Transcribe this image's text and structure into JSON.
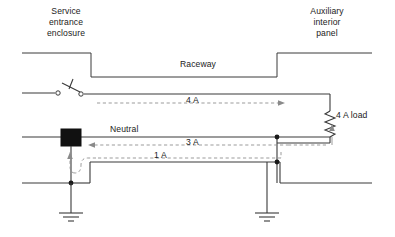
{
  "diagram": {
    "type": "electrical-one-line",
    "background_color": "#ffffff",
    "line_color": "#3a3a3a",
    "flow_color": "#8a8a8a",
    "labels": {
      "service_entrance": "Service\nentrance\nenclosure",
      "service_entrance_line1": "Service",
      "service_entrance_line2": "entrance",
      "service_entrance_line3": "enclosure",
      "auxiliary_panel_line1": "Auxiliary",
      "auxiliary_panel_line2": "interior",
      "auxiliary_panel_line3": "panel",
      "raceway": "Raceway",
      "neutral": "Neutral",
      "load": "4 A load"
    },
    "current_flows": [
      {
        "id": "ungrounded",
        "label": "4 A",
        "direction": "right",
        "conductor": "ungrounded-hot"
      },
      {
        "id": "neutral-return",
        "label": "3 A",
        "direction": "left",
        "conductor": "neutral"
      },
      {
        "id": "parallel-ground",
        "label": "1 A",
        "direction": "left",
        "conductor": "equipment-ground"
      }
    ],
    "components": [
      {
        "name": "disconnect-switch",
        "type": "open-knife-switch"
      },
      {
        "name": "load-resistor",
        "type": "resistor",
        "rating": "4 A load"
      },
      {
        "name": "main-bonding-jumper",
        "type": "solid-box"
      },
      {
        "name": "service-ground-electrode",
        "type": "earth-ground"
      },
      {
        "name": "panel-ground-electrode",
        "type": "earth-ground"
      }
    ],
    "junctions": 4
  }
}
